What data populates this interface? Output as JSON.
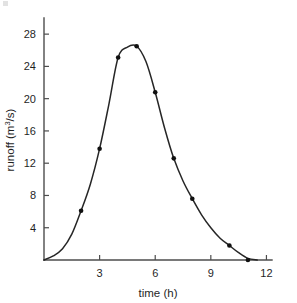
{
  "chart_data": {
    "type": "line",
    "title": "",
    "subtitle": "",
    "xlabel": "time (h)",
    "ylabel": "runoff (m3/s)",
    "ylabel_base": "runoff (m",
    "ylabel_sup": "3",
    "ylabel_tail": "/s)",
    "x": [
      0,
      0.5,
      1,
      1.5,
      2,
      2.5,
      3,
      3.5,
      4,
      4.5,
      5,
      5.5,
      6,
      6.5,
      7,
      7.5,
      8,
      8.5,
      9,
      9.5,
      10,
      10.5,
      11,
      11.5
    ],
    "values": [
      0,
      0.5,
      1.4,
      3.2,
      6.1,
      9.4,
      13.8,
      19.3,
      25.1,
      26.4,
      26.5,
      24.6,
      20.8,
      16.4,
      12.6,
      9.8,
      7.6,
      5.6,
      4.0,
      2.7,
      1.8,
      0.9,
      0.2,
      0.0
    ],
    "markers": [
      {
        "x": 2,
        "y": 6.1
      },
      {
        "x": 3,
        "y": 13.8
      },
      {
        "x": 4,
        "y": 25.1
      },
      {
        "x": 5,
        "y": 26.5
      },
      {
        "x": 6,
        "y": 20.8
      },
      {
        "x": 7,
        "y": 12.6
      },
      {
        "x": 8,
        "y": 7.6
      },
      {
        "x": 10,
        "y": 1.8
      },
      {
        "x": 11,
        "y": 0.0
      }
    ],
    "xlim": [
      0,
      12.3
    ],
    "ylim": [
      0,
      30
    ],
    "xticks": [
      3,
      6,
      9,
      12
    ],
    "yticks": [
      4,
      8,
      12,
      16,
      20,
      24,
      28
    ],
    "xtick_labels": [
      "3",
      "6",
      "9",
      "12"
    ],
    "ytick_labels": [
      "4",
      "8",
      "12",
      "16",
      "20",
      "24",
      "28"
    ],
    "grid": false,
    "legend": null,
    "series_name": "runoff hydrograph",
    "line_color": "#262626",
    "marker_color": "#101010",
    "axis_color": "#4d4d4d",
    "background_color": "#ffffff"
  }
}
